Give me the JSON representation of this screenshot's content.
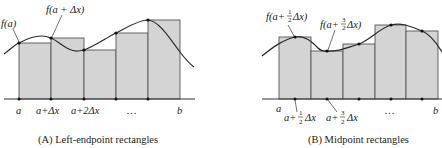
{
  "panels": [
    {
      "id": "A",
      "caption": "(A) Left-endpoint rectangles",
      "curve_label_1": "f(a)",
      "curve_label_2": "f(a + Δx)",
      "ticks": [
        "a",
        "a+Δx",
        "a+2Δx",
        "…",
        "b"
      ],
      "edges_x": [
        19,
        51,
        84,
        116,
        148,
        180
      ],
      "rect_tops_y": [
        43,
        38,
        50,
        33,
        20
      ],
      "sample": "left-endpoint"
    },
    {
      "id": "B",
      "caption": "(B) Midpoint rectangles",
      "curve_label_1_pre": "f(a+",
      "curve_label_1_num": "1",
      "curve_label_1_den": "2",
      "curve_label_1_post": "Δx)",
      "curve_label_2_pre": "f(a+",
      "curve_label_2_num": "3",
      "curve_label_2_den": "2",
      "curve_label_2_post": "Δx)",
      "tick_a": "a",
      "tick_b": "b",
      "tick_dots": "…",
      "tick_mid1_pre": "a+",
      "tick_mid1_num": "1",
      "tick_mid1_den": "2",
      "tick_mid1_post": "Δx",
      "tick_mid2_pre": "a+",
      "tick_mid2_num": "3",
      "tick_mid2_den": "2",
      "tick_mid2_post": "Δx",
      "edges_x": [
        279,
        311,
        343,
        375,
        406,
        438
      ],
      "midpoints_x": [
        295,
        327,
        359,
        391,
        422
      ],
      "rect_tops_y": [
        37,
        51,
        44,
        25,
        31
      ],
      "sample": "midpoint"
    }
  ],
  "colors": {
    "rect_fill": "#d4d4d4",
    "rect_stroke": "#555555",
    "curve": "#2a2a2a",
    "background": "#ffffff"
  }
}
